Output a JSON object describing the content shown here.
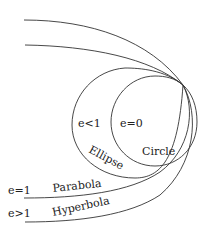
{
  "diagram": {
    "curves": [
      {
        "id": "circle",
        "name": "Circle",
        "condition": "e=0"
      },
      {
        "id": "ellipse",
        "name": "Ellipse",
        "condition": "e<1"
      },
      {
        "id": "parabola",
        "name": "Parabola",
        "condition": "e=1"
      },
      {
        "id": "hyperbola",
        "name": "Hyperbola",
        "condition": "e>1"
      }
    ],
    "labels": {
      "ellipse_condition": "e<1",
      "circle_condition": "e=0",
      "ellipse_name": "Ellipse",
      "circle_name": "Circle",
      "parabola_condition": "e=1",
      "parabola_name": "Parabola",
      "hyperbola_condition": "e>1",
      "hyperbola_name": "Hyperbola"
    },
    "stroke_color": "#333333"
  }
}
